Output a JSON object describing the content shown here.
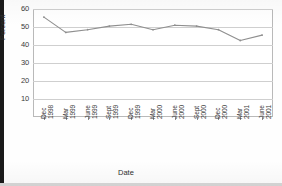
{
  "chart_data": {
    "type": "line",
    "title": "",
    "xlabel": "Date",
    "ylabel": "Percent",
    "ylim": [
      0,
      60
    ],
    "yticks": [
      10,
      20,
      30,
      40,
      50,
      60
    ],
    "grid": true,
    "legend": "none",
    "categories": [
      "Dec 1998",
      "Mar 1999",
      "June 1999",
      "Sept 1999",
      "Dec 1999",
      "Mar 2000",
      "June 2000",
      "Sept 2000",
      "Dec 2000",
      "Mar 2001",
      "June 2001"
    ],
    "category_lines": [
      [
        "Dec",
        "1998"
      ],
      [
        "Mar",
        "1999"
      ],
      [
        "June",
        "1999"
      ],
      [
        "Sept",
        "1999"
      ],
      [
        "Dec",
        "1999"
      ],
      [
        "Mar",
        "2000"
      ],
      [
        "June",
        "2000"
      ],
      [
        "Sept",
        "2000"
      ],
      [
        "Dec",
        "2000"
      ],
      [
        "Mar",
        "2001"
      ],
      [
        "June",
        "2001"
      ]
    ],
    "values": [
      55.5,
      47.0,
      48.5,
      50.5,
      51.5,
      48.5,
      51.0,
      50.5,
      48.5,
      42.5,
      45.5
    ],
    "series_color": "#8f8f8f",
    "grid_color": "#cfcfcf",
    "axis_color": "#b9b9b9",
    "text_color": "#3a3a3a"
  }
}
